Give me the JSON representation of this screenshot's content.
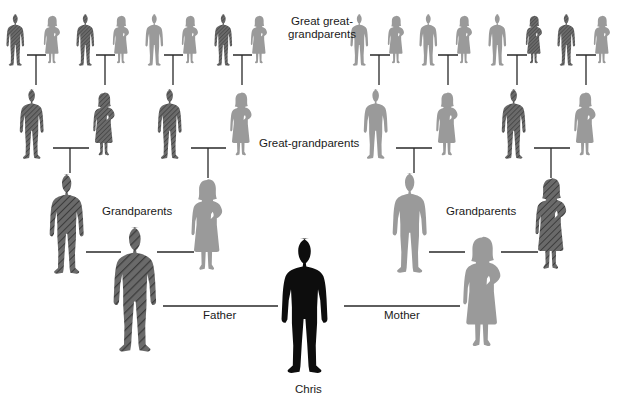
{
  "colors": {
    "self": "#0d0d0d",
    "dark_hatched": "#5a5a5a",
    "light": "#9a9a9a",
    "connector": "#2a2a2a",
    "text": "#1a1a1a"
  },
  "labels": {
    "great_great_grandparents_line1": "Great great-",
    "great_great_grandparents_line2": "grandparents",
    "great_grandparents": "Great-grandparents",
    "grandparents_left": "Grandparents",
    "grandparents_right": "Grandparents",
    "father": "Father",
    "mother": "Mother",
    "self": "Chris"
  },
  "legend_note": "Dark hatched figures = direct male-line / shared ancestors; light figures = other ancestors; black = Chris",
  "generations": {
    "great_great_grandparents": [
      {
        "sex": "male",
        "shade": "dark",
        "x": 17
      },
      {
        "sex": "female",
        "shade": "light",
        "x": 52
      },
      {
        "sex": "male",
        "shade": "dark",
        "x": 87
      },
      {
        "sex": "female",
        "shade": "light",
        "x": 121
      },
      {
        "sex": "male",
        "shade": "light",
        "x": 156
      },
      {
        "sex": "female",
        "shade": "light",
        "x": 190
      },
      {
        "sex": "male",
        "shade": "dark",
        "x": 225
      },
      {
        "sex": "female",
        "shade": "light",
        "x": 259
      },
      {
        "sex": "male",
        "shade": "light",
        "x": 361
      },
      {
        "sex": "female",
        "shade": "light",
        "x": 396
      },
      {
        "sex": "male",
        "shade": "light",
        "x": 430
      },
      {
        "sex": "female",
        "shade": "light",
        "x": 464
      },
      {
        "sex": "male",
        "shade": "light",
        "x": 499
      },
      {
        "sex": "female",
        "shade": "dark",
        "x": 534
      },
      {
        "sex": "male",
        "shade": "dark",
        "x": 568
      },
      {
        "sex": "female",
        "shade": "light",
        "x": 602
      }
    ],
    "great_grandparents": [
      {
        "sex": "male",
        "shade": "dark",
        "x": 34
      },
      {
        "sex": "female",
        "shade": "dark",
        "x": 104
      },
      {
        "sex": "male",
        "shade": "dark",
        "x": 172
      },
      {
        "sex": "female",
        "shade": "light",
        "x": 241
      },
      {
        "sex": "male",
        "shade": "light",
        "x": 378
      },
      {
        "sex": "female",
        "shade": "light",
        "x": 447
      },
      {
        "sex": "male",
        "shade": "dark",
        "x": 516
      },
      {
        "sex": "female",
        "shade": "light",
        "x": 585
      }
    ],
    "grandparents": [
      {
        "sex": "male",
        "shade": "dark",
        "x": 69
      },
      {
        "sex": "female",
        "shade": "light",
        "x": 206
      },
      {
        "sex": "male",
        "shade": "light",
        "x": 412
      },
      {
        "sex": "female",
        "shade": "dark",
        "x": 551
      }
    ],
    "parents": [
      {
        "sex": "male",
        "shade": "dark",
        "x": 138,
        "role": "Father"
      },
      {
        "sex": "female",
        "shade": "light",
        "x": 482,
        "role": "Mother"
      }
    ],
    "self": {
      "sex": "male",
      "shade": "black",
      "x": 309,
      "name": "Chris"
    }
  }
}
